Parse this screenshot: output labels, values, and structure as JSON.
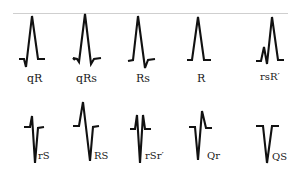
{
  "figure": {
    "rule_color": "#cfcfcf",
    "stroke_color": "#111111",
    "top_row": [
      {
        "label": "qR",
        "pattern": "q-wave then tall R"
      },
      {
        "label": "qRs",
        "pattern": "small q, tall R, small s"
      },
      {
        "label": "Rs",
        "pattern": "tall R, small s"
      },
      {
        "label": "R",
        "pattern": "monophasic R"
      },
      {
        "label": "rsR′",
        "pattern": "small r, s, tall R prime"
      }
    ],
    "bottom_row": [
      {
        "label": "rS",
        "pattern": "small r, deep S"
      },
      {
        "label": "RS",
        "pattern": "tall R, deep S"
      },
      {
        "label": "rSr′",
        "pattern": "small r, deep S, small r prime"
      },
      {
        "label": "Qr",
        "pattern": "deep Q, small r"
      },
      {
        "label": "QS",
        "pattern": "monophasic negative QS"
      }
    ]
  }
}
